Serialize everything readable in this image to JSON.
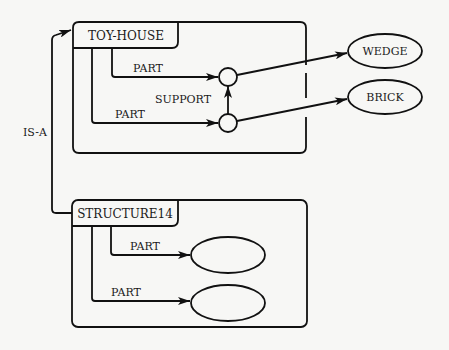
{
  "diagram": {
    "type": "semantic-network",
    "colors": {
      "ink": "#111111",
      "background": "#f7f7f5"
    },
    "frames": [
      {
        "id": "toy-house",
        "label": "TOY-HOUSE",
        "slots": [
          {
            "relation": "PART",
            "target": "circle-upper"
          },
          {
            "relation": "PART",
            "target": "circle-lower"
          }
        ],
        "internal_relation": {
          "label": "SUPPORT",
          "from": "circle-lower",
          "to": "circle-upper"
        }
      },
      {
        "id": "structure14",
        "label": "STRUCTURE14",
        "slots": [
          {
            "relation": "PART",
            "target": "ellipse-empty-1"
          },
          {
            "relation": "PART",
            "target": "ellipse-empty-2"
          }
        ]
      }
    ],
    "external_nodes": [
      {
        "id": "wedge",
        "label": "WEDGE"
      },
      {
        "id": "brick",
        "label": "BRICK"
      }
    ],
    "links": [
      {
        "from": "circle-upper",
        "to": "wedge"
      },
      {
        "from": "circle-lower",
        "to": "brick"
      },
      {
        "from": "structure14",
        "to": "toy-house",
        "label": "IS-A"
      }
    ],
    "labels": {
      "toy_house": "TOY-HOUSE",
      "structure14": "STRUCTURE14",
      "part": "PART",
      "support": "SUPPORT",
      "is_a": "IS-A",
      "wedge": "WEDGE",
      "brick": "BRICK"
    }
  }
}
